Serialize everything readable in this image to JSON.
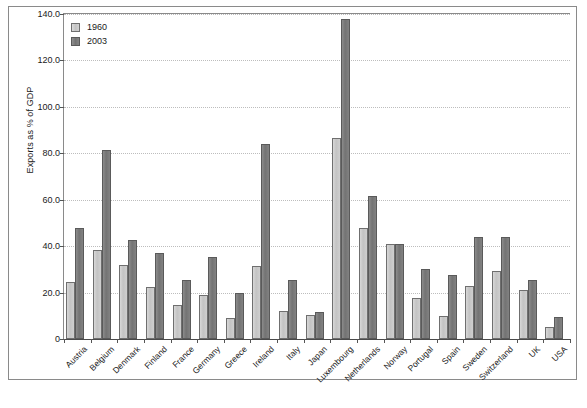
{
  "chart_data": {
    "type": "bar",
    "title": "",
    "xlabel": "",
    "ylabel": "Exports as % of GDP",
    "ylim": [
      0,
      140
    ],
    "ytick_labels": [
      "0",
      "20.0",
      "40.0",
      "60.0",
      "80.0",
      "100.0",
      "120.0",
      "140.0"
    ],
    "ytick_values": [
      0,
      20,
      40,
      60,
      80,
      100,
      120,
      140
    ],
    "grid": true,
    "legend_position": "top-left",
    "categories": [
      "Austria",
      "Belgium",
      "Denmark",
      "Finland",
      "France",
      "Germany",
      "Greece",
      "Ireland",
      "Italy",
      "Japan",
      "Luxembourg",
      "Netherlands",
      "Norway",
      "Portugal",
      "Spain",
      "Sweden",
      "Switzerland",
      "UK",
      "USA"
    ],
    "series": [
      {
        "name": "1960",
        "color": "#c3c3c3",
        "values": [
          24.5,
          38.5,
          32.0,
          22.5,
          14.5,
          19.0,
          9.0,
          31.5,
          12.0,
          10.5,
          86.5,
          47.8,
          41.0,
          17.5,
          10.0,
          22.8,
          29.5,
          20.9,
          5.0
        ]
      },
      {
        "name": "2003",
        "color": "#737373",
        "values": [
          48.0,
          81.5,
          42.5,
          37.0,
          25.5,
          35.5,
          20.0,
          83.8,
          25.5,
          11.5,
          138.0,
          61.5,
          41.0,
          30.0,
          27.5,
          43.8,
          44.0,
          25.5,
          9.5
        ]
      }
    ]
  },
  "legend": {
    "items": [
      {
        "label": "1960"
      },
      {
        "label": "2003"
      }
    ]
  }
}
